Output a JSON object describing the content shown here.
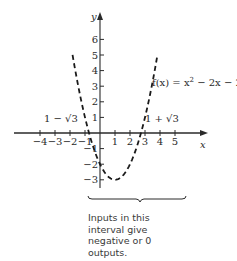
{
  "chart_data": {
    "type": "line",
    "title": "",
    "function_label": "f(x) = x² − 2x − 2",
    "xlabel": "x",
    "ylabel": "y",
    "x_ticks": [
      -4,
      -3,
      -2,
      -1,
      1,
      2,
      3,
      4,
      5
    ],
    "x_tick_labels": [
      "−4",
      "−3",
      "−2",
      "−1",
      "1",
      "2",
      "3",
      "4",
      "5"
    ],
    "y_ticks": [
      6,
      5,
      4,
      3,
      2,
      1,
      -1,
      -2,
      -3
    ],
    "y_tick_labels": [
      "6",
      "5",
      "4",
      "3",
      "2",
      "1",
      "−1",
      "−2",
      "−3"
    ],
    "xlim": [
      -4.5,
      5.8
    ],
    "ylim": [
      -3.3,
      7
    ],
    "grid": false,
    "line_style": "dashed",
    "series": [
      {
        "name": "f(x) = x^2 - 2x - 2",
        "x": [
          -1.83,
          -1.5,
          -1,
          -0.732,
          -0.5,
          0,
          0.5,
          1,
          1.5,
          2,
          2.5,
          2.732,
          3,
          3.5,
          3.83
        ],
        "values": [
          6,
          3.25,
          1,
          0,
          -0.75,
          -2,
          -2.75,
          -3,
          -2.75,
          -2,
          -0.75,
          0,
          1,
          3.25,
          6
        ]
      }
    ],
    "annotations": [
      {
        "text": "1 − √3",
        "x": -0.732,
        "y": 0
      },
      {
        "text": "1 + √3",
        "x": 2.732,
        "y": 0
      },
      {
        "text": "Inputs in this interval give negative or 0 outputs.",
        "interval": [
          -0.732,
          2.732
        ]
      }
    ]
  },
  "labels": {
    "y_axis": "y",
    "x_axis": "x",
    "fx_prefix": "f(x) = x",
    "fx_exp": "2",
    "fx_suffix": " − 2x − 2",
    "root_left": "1 − √3",
    "root_right": "1 + √3",
    "note_lines": [
      "Inputs in this",
      "interval give",
      "negative or 0",
      "outputs."
    ]
  }
}
